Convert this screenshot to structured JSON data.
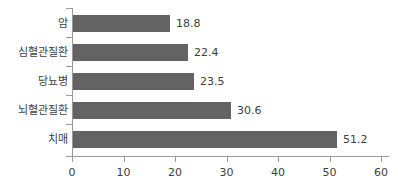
{
  "chart_data": {
    "type": "bar",
    "orientation": "horizontal",
    "title": "",
    "xlabel": "",
    "ylabel": "",
    "categories": [
      "암",
      "심혈관질환",
      "당뇨병",
      "뇌혈관질환",
      "치매"
    ],
    "values": [
      18.8,
      22.4,
      23.5,
      30.6,
      51.2
    ],
    "value_labels": [
      "18.8",
      "22.4",
      "23.5",
      "30.6",
      "51.2"
    ],
    "xlim": [
      0,
      65
    ],
    "xticks": [
      0,
      10,
      20,
      30,
      40,
      50,
      60
    ],
    "xtick_labels": [
      "0",
      "10",
      "20",
      "30",
      "40",
      "50",
      "60"
    ],
    "grid": false,
    "legend": null,
    "series": [
      {
        "name": "",
        "values": [
          18.8,
          22.4,
          23.5,
          30.6,
          51.2
        ]
      }
    ],
    "colors": {
      "bar": "#636363",
      "text": "#404040",
      "axis": "#9a9a9a",
      "background": "#ffffff"
    }
  }
}
